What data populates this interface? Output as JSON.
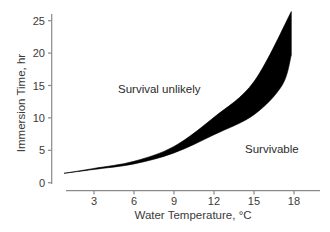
{
  "chart_data": {
    "type": "area",
    "title": "",
    "xlabel": "Water Temperature, °C",
    "ylabel": "Immersion Time, hr",
    "xlim": [
      0,
      19.5
    ],
    "ylim": [
      0,
      26
    ],
    "x_ticks": [
      3,
      6,
      9,
      12,
      15,
      18
    ],
    "y_ticks": [
      0,
      5,
      10,
      15,
      20,
      25
    ],
    "grid": false,
    "legend": null,
    "series": [
      {
        "name": "Upper boundary (survival limit, upper estimate)",
        "points": [
          [
            0.75,
            1.45
          ],
          [
            3,
            2.2
          ],
          [
            6,
            3.3
          ],
          [
            9,
            5.6
          ],
          [
            12,
            10.1
          ],
          [
            15,
            15.6
          ],
          [
            17.8,
            26.4
          ]
        ]
      },
      {
        "name": "Lower boundary (survival limit, lower estimate)",
        "points": [
          [
            0.75,
            1.45
          ],
          [
            3,
            2.05
          ],
          [
            6,
            2.9
          ],
          [
            9,
            4.6
          ],
          [
            12,
            7.4
          ],
          [
            15,
            10.5
          ],
          [
            17.1,
            15.0
          ],
          [
            17.8,
            19.7
          ]
        ]
      }
    ],
    "annotations": [
      {
        "text": "Survival unlikely",
        "x": 7,
        "y": 14.3
      },
      {
        "text": "Survivable",
        "x": 15.5,
        "y": 5.2
      }
    ]
  }
}
